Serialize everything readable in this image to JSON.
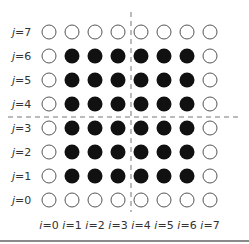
{
  "diagram": {
    "grid_size": 8,
    "filled_color": "#111111",
    "hollow_stroke": "#555555",
    "divider_color": "#777777",
    "row_labels": [
      "j=7",
      "j=6",
      "j=5",
      "j=4",
      "j=3",
      "j=2",
      "j=1",
      "j=0"
    ],
    "column_labels": [
      "i=0",
      "i=1",
      "i=2",
      "i=3",
      "i=4",
      "i=5",
      "i=6",
      "i=7"
    ],
    "rows": [
      {
        "j": 7,
        "filled": [
          0,
          0,
          0,
          0,
          0,
          0,
          0,
          0
        ]
      },
      {
        "j": 6,
        "filled": [
          0,
          1,
          1,
          1,
          1,
          1,
          1,
          0
        ]
      },
      {
        "j": 5,
        "filled": [
          0,
          1,
          1,
          1,
          1,
          1,
          1,
          0
        ]
      },
      {
        "j": 4,
        "filled": [
          0,
          1,
          1,
          1,
          1,
          1,
          1,
          0
        ]
      },
      {
        "j": 3,
        "filled": [
          0,
          1,
          1,
          1,
          1,
          1,
          1,
          0
        ]
      },
      {
        "j": 2,
        "filled": [
          0,
          1,
          1,
          1,
          1,
          1,
          1,
          0
        ]
      },
      {
        "j": 1,
        "filled": [
          0,
          1,
          1,
          1,
          1,
          1,
          1,
          0
        ]
      },
      {
        "j": 0,
        "filled": [
          0,
          0,
          0,
          0,
          0,
          0,
          0,
          0
        ]
      }
    ],
    "dividers": {
      "vertical_between_columns": [
        3,
        4
      ],
      "horizontal_between_rows": [
        4,
        3
      ]
    }
  }
}
